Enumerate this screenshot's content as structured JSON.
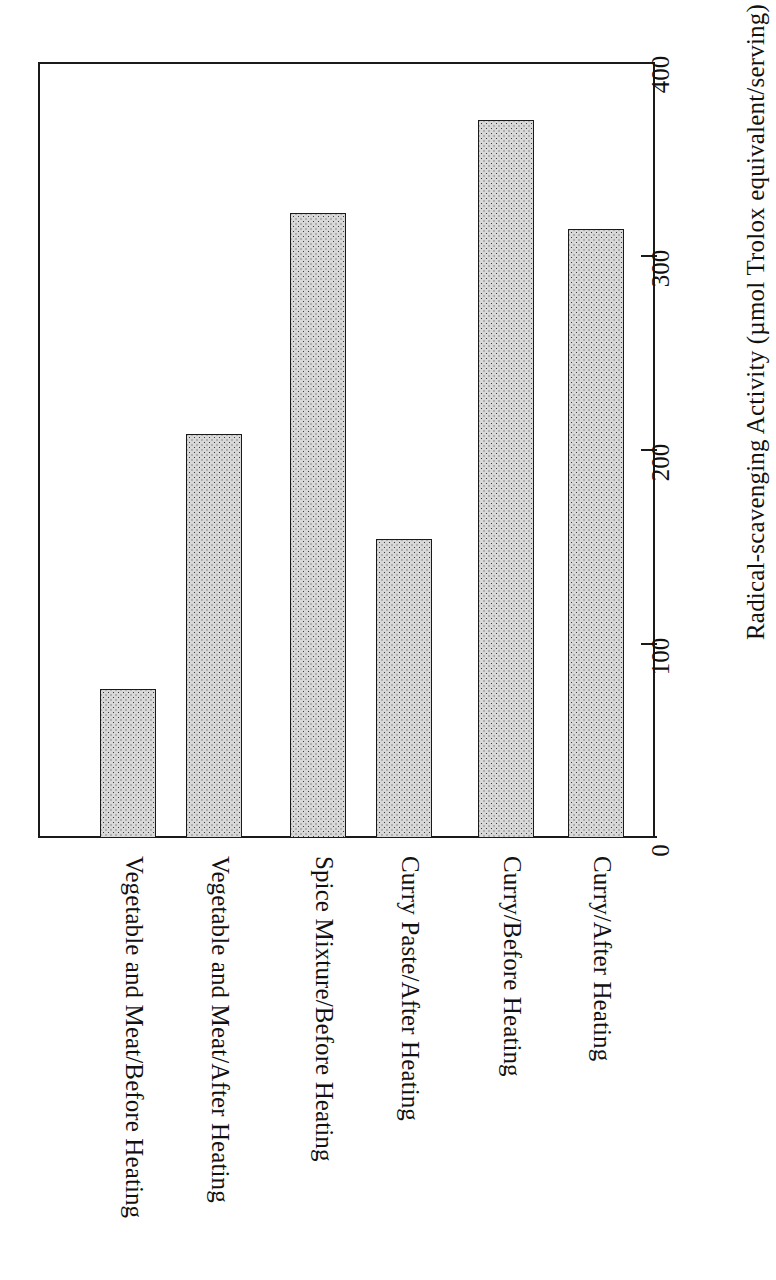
{
  "chart_data": {
    "type": "bar",
    "title": "",
    "subtitle": "",
    "orientation": "vertical-rotated",
    "categories": [
      "Vegetable and Meat/Before Heating",
      "Vegetable and Meat/After Heating",
      "Spice Mixture/Before Heating",
      "Curry Paste/After Heating",
      "Curry/Before Heating",
      "Curry/After Heating"
    ],
    "values": [
      77,
      208,
      322,
      154,
      370,
      314
    ],
    "xlabel": "",
    "ylabel": "Radical-scavenging Activity (µmol Trolox equivalent/serving)",
    "ylim": [
      0,
      400
    ],
    "yticks": [
      0,
      100,
      200,
      300,
      400
    ],
    "ytick_labels": [
      "0",
      "100",
      "200",
      "300",
      "400"
    ],
    "grid": false,
    "legend": null,
    "bar_fill": "#d8d8d8",
    "bar_edge": "#1a1a1a",
    "group_gaps_after": [
      1,
      3
    ]
  },
  "axis": {
    "title": "Radical-scavenging Activity (µmol Trolox equivalent/serving)",
    "ticks": [
      {
        "value": 0,
        "label": "0"
      },
      {
        "value": 100,
        "label": "100"
      },
      {
        "value": 200,
        "label": "200"
      },
      {
        "value": 300,
        "label": "300"
      },
      {
        "value": 400,
        "label": "400"
      }
    ]
  },
  "bars": [
    {
      "label": "Vegetable and Meat/Before Heating",
      "value": 77
    },
    {
      "label": "Vegetable and Meat/After Heating",
      "value": 208
    },
    {
      "label": "Spice Mixture/Before Heating",
      "value": 322
    },
    {
      "label": "Curry Paste/After Heating",
      "value": 154
    },
    {
      "label": "Curry/Before Heating",
      "value": 370
    },
    {
      "label": "Curry/After Heating",
      "value": 314
    }
  ]
}
